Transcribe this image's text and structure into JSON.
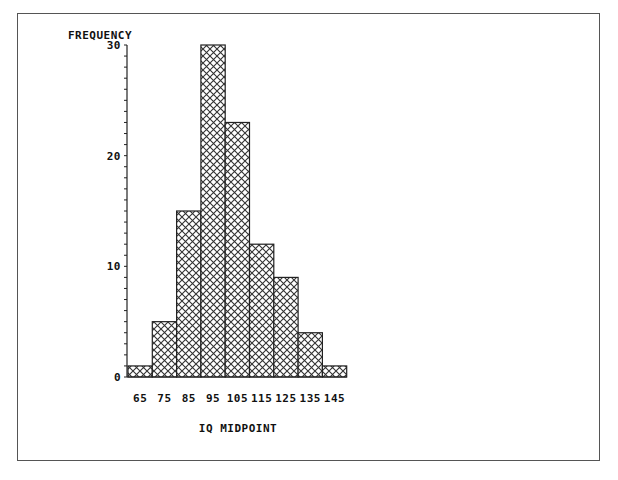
{
  "chart_data": {
    "type": "bar",
    "title": "",
    "xlabel": "IQ MIDPOINT",
    "ylabel": "FREQUENCY",
    "categories": [
      "65",
      "75",
      "85",
      "95",
      "105",
      "115",
      "125",
      "135",
      "145"
    ],
    "values": [
      1,
      5,
      15,
      30,
      23,
      12,
      9,
      4,
      1
    ],
    "ylim": [
      0,
      30
    ],
    "y_ticks": [
      0,
      10,
      20,
      30
    ],
    "y_minor_tick_step": 1,
    "grid": false,
    "legend": null,
    "bar_fill": "crosshatch",
    "histogram": true
  },
  "colors": {
    "bar_stroke": "#222222",
    "hatch": "#333333",
    "frame": "#555555",
    "background": "#ffffff"
  }
}
